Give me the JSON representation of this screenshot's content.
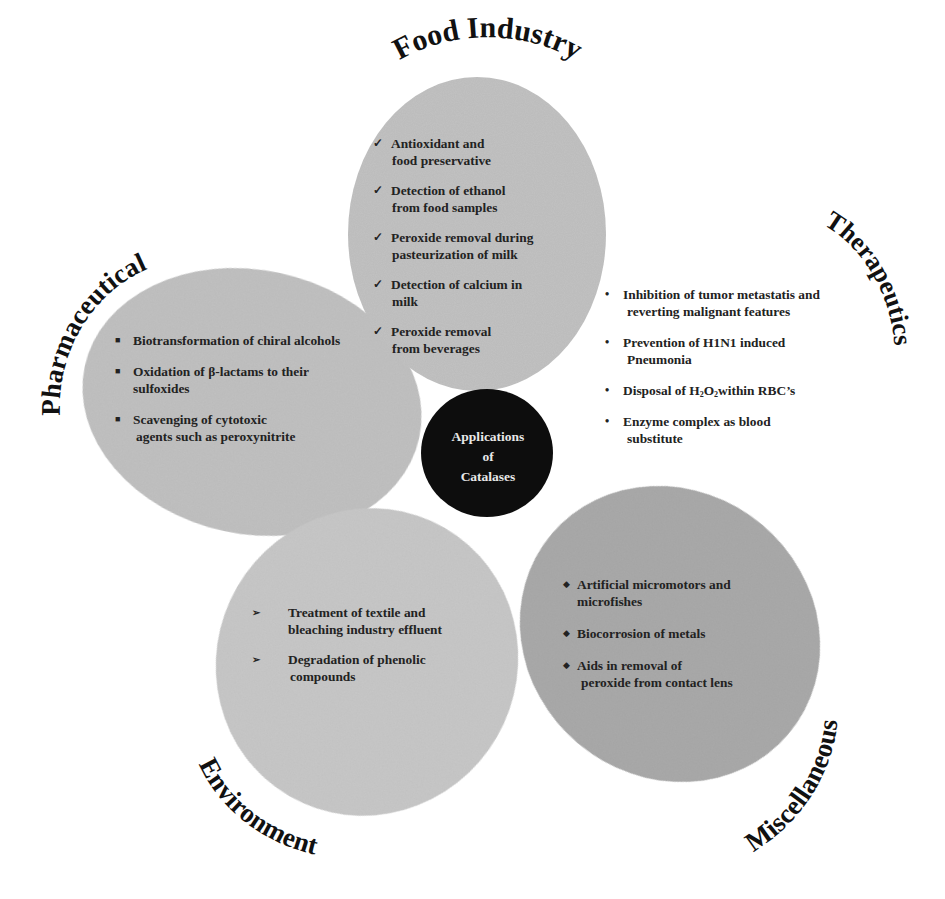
{
  "diagram": {
    "center": {
      "lines": [
        "Applications",
        "of",
        "Catalases"
      ],
      "fill": "#0d0d0d",
      "text_color": "#e8e8e8"
    },
    "colors": {
      "petal_light": "#c4c4c4",
      "petal_mid": "#bdbdbd",
      "petal_dark": "#a9a9a9",
      "text": "#222222",
      "background": "#ffffff"
    },
    "sections": {
      "food": {
        "title": "Food Industry",
        "bullet": "✓",
        "items": [
          {
            "line1": "Antioxidant and",
            "line2": "food preservative"
          },
          {
            "line1": "Detection of ethanol",
            "line2": "from food samples"
          },
          {
            "line1": "Peroxide removal during",
            "line2": "pasteurization of milk"
          },
          {
            "line1": "Detection of calcium in",
            "line2": "milk"
          },
          {
            "line1": "Peroxide removal",
            "line2": "from beverages"
          }
        ]
      },
      "pharmaceutical": {
        "title": "Pharmaceutical",
        "bullet": "■",
        "items": [
          {
            "line1": "Biotransformation of chiral alcohols",
            "line2": ""
          },
          {
            "line1": "Oxidation of β-lactams to their",
            "line2": "sulfoxides"
          },
          {
            "line1": "Scavenging of cytotoxic",
            "line2": "agents such as peroxynitrite"
          }
        ]
      },
      "therapeutics": {
        "title": "Therapeutics",
        "bullet": "•",
        "items": [
          {
            "line1": "Inhibition of tumor metastatis and",
            "line2": "reverting malignant features"
          },
          {
            "line1": "Prevention of H1N1 induced",
            "line2": "Pneumonia"
          },
          {
            "line1_pre": "Disposal of H",
            "sub1": "2",
            "line1_mid": "O",
            "sub2": "2",
            "line1_post": "within RBC’s",
            "line1": "Disposal of H2O2 within RBC’s",
            "line2": ""
          },
          {
            "line1": "Enzyme complex as blood",
            "line2": "substitute"
          }
        ]
      },
      "environment": {
        "title": "Environment",
        "bullet": "➢",
        "items": [
          {
            "line1": "Treatment of textile and",
            "line2": "bleaching industry effluent"
          },
          {
            "line1": "Degradation of phenolic",
            "line2": "compounds"
          }
        ]
      },
      "miscellaneous": {
        "title": "Miscellaneous",
        "bullet": "◆",
        "items": [
          {
            "line1": "Artificial micromotors and",
            "line2": "microfishes"
          },
          {
            "line1": "Biocorrosion of metals",
            "line2": ""
          },
          {
            "line1": "Aids in removal of",
            "line2": "peroxide from contact lens"
          }
        ]
      }
    }
  }
}
